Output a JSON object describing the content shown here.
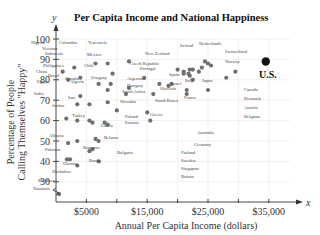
{
  "chart_data": {
    "type": "scatter",
    "title": "Per Capita Income and National Happiness",
    "xlabel": "Annual Per Capita Income (dollars)",
    "ylabel": "Percentage of People Calling Themselves \"Happy\"",
    "ylabel_lines": [
      "Percentage of People",
      "Calling Themselves \"Happy\""
    ],
    "x_axis_var": "x",
    "y_axis_var": "y",
    "xlim": [
      0,
      40000
    ],
    "ylim": [
      25,
      100
    ],
    "x_ticks": [
      5000,
      10000,
      15000,
      20000,
      25000,
      30000,
      35000
    ],
    "x_tick_labels": [
      {
        "value": 5000,
        "label": "$5000"
      },
      {
        "value": 15000,
        "label": "$15,000"
      },
      {
        "value": 25000,
        "label": "$25,000"
      },
      {
        "value": 35000,
        "label": "$35,000"
      }
    ],
    "y_ticks": [
      30,
      40,
      50,
      60,
      70,
      80,
      90,
      100
    ],
    "y_tick_labels": [
      "30",
      "40",
      "50",
      "60",
      "70",
      "80",
      "90",
      "100"
    ],
    "grid": true,
    "legend": null,
    "highlight": {
      "label": "U.S.",
      "x": 34500,
      "y": 89
    },
    "points": [
      {
        "label": "Nigeria",
        "x": 1100,
        "y": 84,
        "lx": 31,
        "ly": 44,
        "leader": [
          [
            58,
            84
          ],
          [
            58,
            44
          ]
        ]
      },
      {
        "label": "Colombia",
        "x": 6500,
        "y": 88,
        "lx": 59,
        "ly": 44
      },
      {
        "label": "Venezuela",
        "x": 12000,
        "y": 89,
        "lx": 88,
        "ly": 44,
        "leader": [
          [
            112,
            89
          ],
          [
            112,
            44
          ]
        ]
      },
      {
        "label": "Vietnam",
        "x": 2000,
        "y": 80,
        "lx": 42,
        "ly": 50,
        "leader": [
          [
            68,
            80
          ],
          [
            68,
            50
          ]
        ]
      },
      {
        "label": "Indonesia",
        "x": 3000,
        "y": 86,
        "lx": 45,
        "ly": 55
      },
      {
        "label": "Mexico",
        "x": 8500,
        "y": 88,
        "lx": 87,
        "ly": 56
      },
      {
        "label": "Chile",
        "x": 9300,
        "y": 83,
        "lx": 84,
        "ly": 67
      },
      {
        "label": "Philippines",
        "x": 4000,
        "y": 81,
        "lx": 43,
        "ly": 67,
        "leader": [
          [
            78,
            81
          ],
          [
            78,
            67
          ]
        ]
      },
      {
        "label": "China",
        "x": 4000,
        "y": 72,
        "lx": 36,
        "ly": 73
      },
      {
        "label": "Brazil",
        "x": 7000,
        "y": 78,
        "lx": 48,
        "ly": 77
      },
      {
        "label": "Croatia",
        "x": 8500,
        "y": 75,
        "lx": 65,
        "ly": 80
      },
      {
        "label": "Uruguay",
        "x": 9000,
        "y": 78,
        "lx": 91,
        "ly": 79
      },
      {
        "label": "Czech Republic",
        "x": 14500,
        "y": 81,
        "lx": 130,
        "ly": 65
      },
      {
        "label": "Portugal",
        "x": 17000,
        "y": 78,
        "lx": 140,
        "ly": 70
      },
      {
        "label": "New Zealand",
        "x": 20000,
        "y": 85,
        "lx": 145,
        "ly": 55
      },
      {
        "label": "Argentina",
        "x": 12000,
        "y": 76,
        "lx": 127,
        "ly": 80
      },
      {
        "label": "Hungary",
        "x": 11500,
        "y": 73,
        "lx": 127,
        "ly": 87
      },
      {
        "label": "Spain",
        "x": 19000,
        "y": 78,
        "lx": 169,
        "ly": 76
      },
      {
        "label": "Israel",
        "x": 18500,
        "y": 77,
        "lx": 171,
        "ly": 85
      },
      {
        "label": "Slovenia",
        "x": 16000,
        "y": 73,
        "lx": 160,
        "ly": 90
      },
      {
        "label": "Egypt",
        "x": 3500,
        "y": 68,
        "lx": 37,
        "ly": 83
      },
      {
        "label": "Algeria",
        "x": 5500,
        "y": 68,
        "lx": 70,
        "ly": 83
      },
      {
        "label": "South Africa",
        "x": 8500,
        "y": 69,
        "lx": 122,
        "ly": 93,
        "leader": [
          [
            106,
            69
          ],
          [
            122,
            69
          ]
        ]
      },
      {
        "label": "Slovakia",
        "x": 10000,
        "y": 65,
        "lx": 120,
        "ly": 103
      },
      {
        "label": "South Korea",
        "x": 15000,
        "y": 64,
        "lx": 155,
        "ly": 102
      },
      {
        "label": "Greece",
        "x": 15500,
        "y": 60,
        "lx": 150,
        "ly": 116
      },
      {
        "label": "India",
        "x": 1700,
        "y": 61,
        "lx": 34,
        "ly": 95
      },
      {
        "label": "Jordan",
        "x": 3500,
        "y": 60,
        "lx": 52,
        "ly": 107
      },
      {
        "label": "Iran",
        "x": 5500,
        "y": 60,
        "lx": 68,
        "ly": 99
      },
      {
        "label": "Turkey",
        "x": 6000,
        "y": 59,
        "lx": 72,
        "ly": 117
      },
      {
        "label": "Poland",
        "x": 8000,
        "y": 59,
        "lx": 125,
        "ly": 118
      },
      {
        "label": "Estonia",
        "x": 8500,
        "y": 58,
        "lx": 125,
        "ly": 124
      },
      {
        "label": "Latvia",
        "x": 6500,
        "y": 51,
        "lx": 101,
        "ly": 127
      },
      {
        "label": "Albania",
        "x": 3500,
        "y": 50,
        "lx": 49,
        "ly": 137
      },
      {
        "label": "Belarus",
        "x": 7000,
        "y": 50,
        "lx": 104,
        "ly": 139
      },
      {
        "label": "Romania",
        "x": 6000,
        "y": 46,
        "lx": 83,
        "ly": 149
      },
      {
        "label": "Pakistan",
        "x": 2000,
        "y": 49,
        "lx": 45,
        "ly": 151
      },
      {
        "label": "Bulgaria",
        "x": 5500,
        "y": 45,
        "lx": 117,
        "ly": 154
      },
      {
        "label": "Russia",
        "x": 7000,
        "y": 40,
        "lx": 89,
        "ly": 162
      },
      {
        "label": "Ukraine",
        "x": 3500,
        "y": 38,
        "lx": 63,
        "ly": 165
      },
      {
        "label": "Zimbabwe",
        "x": 2300,
        "y": 41,
        "lx": 52,
        "ly": 173
      },
      {
        "label": "Moldova",
        "x": 1800,
        "y": 41,
        "lx": 38,
        "ly": 182
      },
      {
        "label": "Tanzania",
        "x": 500,
        "y": 24,
        "lx": 33,
        "ly": 190
      },
      {
        "label": "Ireland",
        "x": 22000,
        "y": 85,
        "lx": 180,
        "ly": 47
      },
      {
        "label": "Netherlands",
        "x": 24500,
        "y": 89,
        "lx": 199,
        "ly": 45
      },
      {
        "label": "Switzerland",
        "x": 29500,
        "y": 84,
        "lx": 225,
        "ly": 53
      },
      {
        "label": "Norway",
        "x": 28000,
        "y": 81,
        "lx": 225,
        "ly": 63
      },
      {
        "label": "U.S.",
        "x": 34500,
        "y": 89,
        "lx": 259,
        "ly": 78
      },
      {
        "label": "Italy",
        "x": 21500,
        "y": 75,
        "lx": 185,
        "ly": 82
      },
      {
        "label": "Japan",
        "x": 25000,
        "y": 75,
        "lx": 202,
        "ly": 82
      },
      {
        "label": "France",
        "x": 21500,
        "y": 73,
        "lx": 184,
        "ly": 99
      },
      {
        "label": "Canada",
        "x": 25500,
        "y": 87,
        "lx": 244,
        "ly": 91
      },
      {
        "label": "Denmark",
        "x": 25000,
        "y": 88,
        "lx": 244,
        "ly": 100
      },
      {
        "label": "Austria",
        "x": 24000,
        "y": 86,
        "lx": 244,
        "ly": 109
      },
      {
        "label": "Belgium",
        "x": 23500,
        "y": 84,
        "lx": 244,
        "ly": 118
      },
      {
        "label": "Australia",
        "x": 22500,
        "y": 80,
        "lx": 197,
        "ly": 134
      },
      {
        "label": "Germany",
        "x": 22000,
        "y": 82,
        "lx": 194,
        "ly": 146
      },
      {
        "label": "Finland",
        "x": 21000,
        "y": 84,
        "lx": 181,
        "ly": 154
      },
      {
        "label": "Sweden",
        "x": 21000,
        "y": 83,
        "lx": 181,
        "ly": 162
      },
      {
        "label": "Singapore",
        "x": 21800,
        "y": 83,
        "lx": 181,
        "ly": 170
      },
      {
        "label": "Britain",
        "x": 22500,
        "y": 85,
        "lx": 181,
        "ly": 178
      }
    ]
  },
  "layout": {
    "plot_left": 56,
    "plot_right": 290,
    "plot_top": 39,
    "axis_y": 202,
    "px_per_thousand": 6.08,
    "px_per_percent": 2.04,
    "y_at_100": 39
  }
}
